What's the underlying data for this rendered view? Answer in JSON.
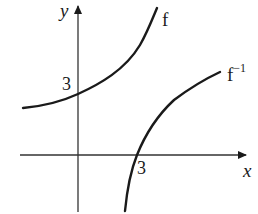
{
  "diagram": {
    "axes": {
      "x_label": "x",
      "y_label": "y",
      "x_tick_label": "3",
      "y_tick_label": "3"
    },
    "curves": [
      {
        "name": "f",
        "label": "f",
        "y_intercept": 3,
        "description": "increasing exponential-like curve, asymptotic to a horizontal line at left"
      },
      {
        "name": "f_inverse",
        "label": "f",
        "label_superscript": "−1",
        "x_intercept": 3,
        "description": "increasing log-like curve, reflection of f in y=x"
      }
    ],
    "colors": {
      "stroke": "#1a1a1a",
      "axis": "#333333",
      "background": "#ffffff"
    }
  }
}
